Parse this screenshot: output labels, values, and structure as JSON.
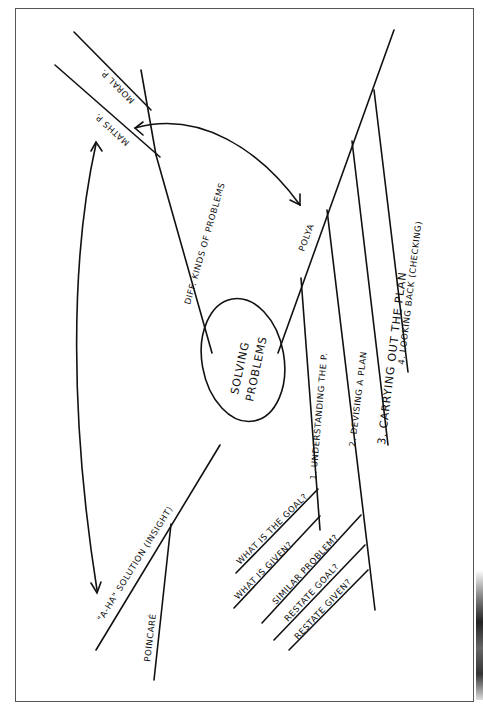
{
  "diagram": {
    "center": {
      "line1": "SOLVING",
      "line2": "PROBLEMS"
    },
    "branches": {
      "diff_kinds": "DIFF. KINDS OF PROBLEMS",
      "maths_p": "MATHS P.",
      "moral_p": "MORAL P.",
      "polya": "POLYA",
      "aha": "\"A-HA\" SOLUTION (INSIGHT)",
      "poincare": "POINCARÉ"
    },
    "polya_steps": [
      "1. UNDERSTANDING THE P.",
      "2. DEVISING A PLAN",
      "3. CARRYING OUT THE PLAN",
      "4. LOOKING BACK (CHECKING)"
    ],
    "understanding_subs": [
      "WHAT IS THE GOAL?",
      "WHAT IS GIVEN?"
    ],
    "plan_subs": [
      "SIMILAR PROBLEM?",
      "RESTATE GOAL?",
      "RESTATE GIVEN?"
    ]
  }
}
